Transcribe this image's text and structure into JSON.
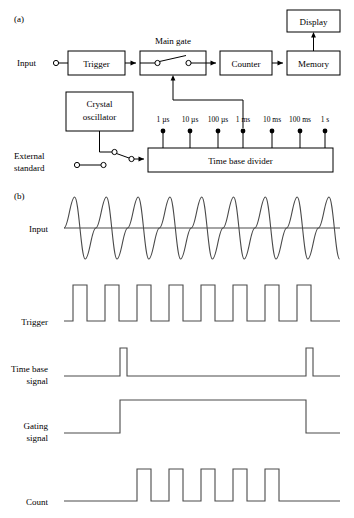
{
  "figure": {
    "panel_a_label": "(a)",
    "panel_b_label": "(b)"
  },
  "block_diagram": {
    "title": "Main  gate",
    "input_label": "Input",
    "blocks": [
      {
        "id": "trigger",
        "label": "Trigger",
        "x": 68,
        "y": 51,
        "w": 57,
        "h": 24
      },
      {
        "id": "main-gate",
        "label": "",
        "x": 140,
        "y": 51,
        "w": 66,
        "h": 24
      },
      {
        "id": "counter",
        "label": "Counter",
        "x": 220,
        "y": 51,
        "w": 52,
        "h": 24
      },
      {
        "id": "memory",
        "label": "Memory",
        "x": 287,
        "y": 51,
        "w": 53,
        "h": 24
      },
      {
        "id": "display",
        "label": "Display",
        "x": 287,
        "y": 10,
        "w": 53,
        "h": 22
      },
      {
        "id": "crystal-oscillator",
        "label_line1": "Crystal",
        "label_line2": "oscillator",
        "x": 66,
        "y": 92,
        "w": 67,
        "h": 39
      },
      {
        "id": "time-base-divider",
        "label": "Time base divider",
        "x": 148,
        "y": 148,
        "w": 185,
        "h": 24
      }
    ],
    "external_standard_line1": "External",
    "external_standard_line2": "standard",
    "taps": [
      {
        "label": "1 µs",
        "x": 163
      },
      {
        "label": "10 µs",
        "x": 190
      },
      {
        "label": "100 µs",
        "x": 218
      },
      {
        "label": "1 ms",
        "x": 243
      },
      {
        "label": "10 ms",
        "x": 272
      },
      {
        "label": "100 ms",
        "x": 300
      },
      {
        "label": "1 s",
        "x": 325
      }
    ]
  },
  "waveforms": {
    "rows": [
      {
        "id": "input",
        "label": "Input",
        "baseline_y": 228
      },
      {
        "id": "trigger",
        "label": "Trigger",
        "baseline_y": 321
      },
      {
        "id": "time-base-signal",
        "label_line1": "Time base",
        "label_line2": "signal",
        "baseline_y": 376
      },
      {
        "id": "gating-signal",
        "label_line1": "Gating",
        "label_line2": "signal",
        "baseline_y": 433
      },
      {
        "id": "count",
        "label": "Count",
        "baseline_y": 501
      }
    ],
    "input_signal": {
      "type": "sine",
      "cycles": 8,
      "x_start": 64,
      "x_end": 340,
      "amplitude": 31
    },
    "trigger_signal": {
      "type": "pulse-train",
      "count": 8,
      "x_start": 73,
      "x_end": 332,
      "pulse_width": 14,
      "height": 36
    },
    "time_base_signal": {
      "type": "pulse-train",
      "count": 2,
      "pulse_positions": [
        120,
        306
      ],
      "pulse_width": 7,
      "height": 28
    },
    "gating_signal": {
      "type": "gate",
      "x_start": 120,
      "x_end": 306,
      "height": 33
    },
    "count_signal": {
      "type": "pulse-train",
      "count": 5,
      "pulse_positions": [
        137,
        169,
        201,
        233,
        265
      ],
      "pulse_width": 14,
      "height": 32
    }
  }
}
